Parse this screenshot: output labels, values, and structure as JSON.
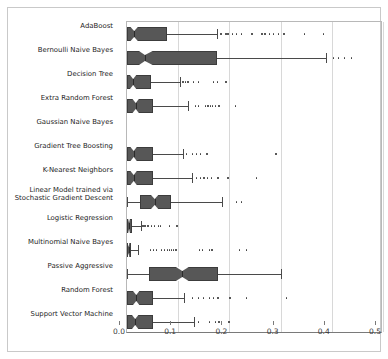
{
  "chart_data": {
    "type": "box",
    "title": "",
    "xlabel": "",
    "ylabel": "",
    "xlim": [
      0.0,
      0.5
    ],
    "xticks": [
      0.0,
      0.1,
      0.2,
      0.3,
      0.4,
      0.5
    ],
    "xticklabels": [
      "0.0",
      "0.1",
      "0.2",
      "0.3",
      "0.4",
      "0.5"
    ],
    "grid": true,
    "orientation": "horizontal",
    "notched": true,
    "box_fill": "#575757",
    "box_edge": "#3c3c3c",
    "categories": [
      "AdaBoost",
      "Bernoulli Naive Bayes",
      "Decision Tree",
      "Extra Random Forest",
      "Gaussian Naive Bayes",
      "Gradient Tree Boosting",
      "K-Nearest Neighbors",
      "Linear Model trained via\nStochastic Gradient Descent",
      "Logistic Regression",
      "Multinomial Naive Bayes",
      "Passive Aggressive",
      "Random Forest",
      "Support Vector Machine"
    ],
    "boxes": [
      {
        "label": "AdaBoost",
        "whisker_low": 0.0,
        "q1": 0.0,
        "median": 0.014,
        "q3": 0.078,
        "whisker_high": 0.175,
        "notch_low": 0.006,
        "notch_high": 0.022,
        "outliers": [
          0.182,
          0.192,
          0.196,
          0.205,
          0.212,
          0.222,
          0.243,
          0.262,
          0.268,
          0.277,
          0.285,
          0.295,
          0.305,
          0.345,
          0.382
        ]
      },
      {
        "label": "Bernoulli Naive Bayes",
        "whisker_low": 0.0,
        "q1": 0.0,
        "median": 0.035,
        "q3": 0.175,
        "whisker_high": 0.388,
        "notch_low": 0.022,
        "notch_high": 0.052,
        "outliers": [
          0.402,
          0.412,
          0.424,
          0.437
        ]
      },
      {
        "label": "Decision Tree",
        "whisker_low": 0.0,
        "q1": 0.0,
        "median": 0.012,
        "q3": 0.046,
        "whisker_high": 0.103,
        "notch_low": 0.005,
        "notch_high": 0.019,
        "outliers": [
          0.108,
          0.113,
          0.118,
          0.128,
          0.138,
          0.168,
          0.175,
          0.192
        ]
      },
      {
        "label": "Extra Random Forest",
        "whisker_low": 0.0,
        "q1": 0.0,
        "median": 0.017,
        "q3": 0.05,
        "whisker_high": 0.12,
        "notch_low": 0.01,
        "notch_high": 0.024,
        "outliers": [
          0.132,
          0.138,
          0.152,
          0.157,
          0.162,
          0.166,
          0.172,
          0.178,
          0.21
        ]
      },
      {
        "label": "Gaussian Naive Bayes",
        "whisker_low": null,
        "q1": null,
        "median": null,
        "q3": null,
        "whisker_high": null,
        "notch_low": null,
        "notch_high": null,
        "outliers": []
      },
      {
        "label": "Gradient Tree Boosting",
        "whisker_low": 0.0,
        "q1": 0.0,
        "median": 0.013,
        "q3": 0.05,
        "whisker_high": 0.11,
        "notch_low": 0.006,
        "notch_high": 0.02,
        "outliers": [
          0.115,
          0.126,
          0.134,
          0.142,
          0.155,
          0.29
        ]
      },
      {
        "label": "K-Nearest Neighbors",
        "whisker_low": 0.0,
        "q1": 0.0,
        "median": 0.013,
        "q3": 0.05,
        "whisker_high": 0.127,
        "notch_low": 0.006,
        "notch_high": 0.02,
        "outliers": [
          0.134,
          0.142,
          0.149,
          0.156,
          0.164,
          0.176,
          0.196,
          0.252
        ]
      },
      {
        "label": "Linear Model trained via Stochastic Gradient Descent",
        "whisker_low": 0.0,
        "q1": 0.026,
        "median": 0.054,
        "q3": 0.086,
        "whisker_high": 0.186,
        "notch_low": 0.046,
        "notch_high": 0.062,
        "outliers": [
          0.212,
          0.222
        ]
      },
      {
        "label": "Logistic Regression",
        "whisker_low": 0.0,
        "q1": 0.0,
        "median": 0.004,
        "q3": 0.01,
        "whisker_high": 0.027,
        "notch_low": 0.002,
        "notch_high": 0.006,
        "outliers": [
          0.03,
          0.034,
          0.04,
          0.046,
          0.052,
          0.06,
          0.064,
          0.082,
          0.096
        ]
      },
      {
        "label": "Multinomial Naive Bayes",
        "whisker_low": 0.0,
        "q1": 0.0,
        "median": 0.003,
        "q3": 0.008,
        "whisker_high": 0.022,
        "notch_low": 0.001,
        "notch_high": 0.005,
        "outliers": [
          0.044,
          0.05,
          0.056,
          0.066,
          0.072,
          0.078,
          0.082,
          0.086,
          0.09,
          0.094,
          0.14,
          0.146,
          0.16,
          0.165,
          0.218,
          0.232
        ]
      },
      {
        "label": "Passive Aggressive",
        "whisker_low": 0.0,
        "q1": 0.042,
        "median": 0.108,
        "q3": 0.178,
        "whisker_high": 0.3,
        "notch_low": 0.094,
        "notch_high": 0.122,
        "outliers": []
      },
      {
        "label": "Random Forest",
        "whisker_low": 0.0,
        "q1": 0.0,
        "median": 0.018,
        "q3": 0.05,
        "whisker_high": 0.112,
        "notch_low": 0.011,
        "notch_high": 0.025,
        "outliers": [
          0.126,
          0.138,
          0.148,
          0.16,
          0.168,
          0.176,
          0.2,
          0.232,
          0.31
        ]
      },
      {
        "label": "Support Vector Machine",
        "whisker_low": 0.0,
        "q1": 0.0,
        "median": 0.016,
        "q3": 0.05,
        "whisker_high": 0.13,
        "notch_low": 0.009,
        "notch_high": 0.023,
        "outliers": [
          0.138,
          0.16,
          0.172,
          0.178,
          0.198
        ]
      }
    ]
  }
}
